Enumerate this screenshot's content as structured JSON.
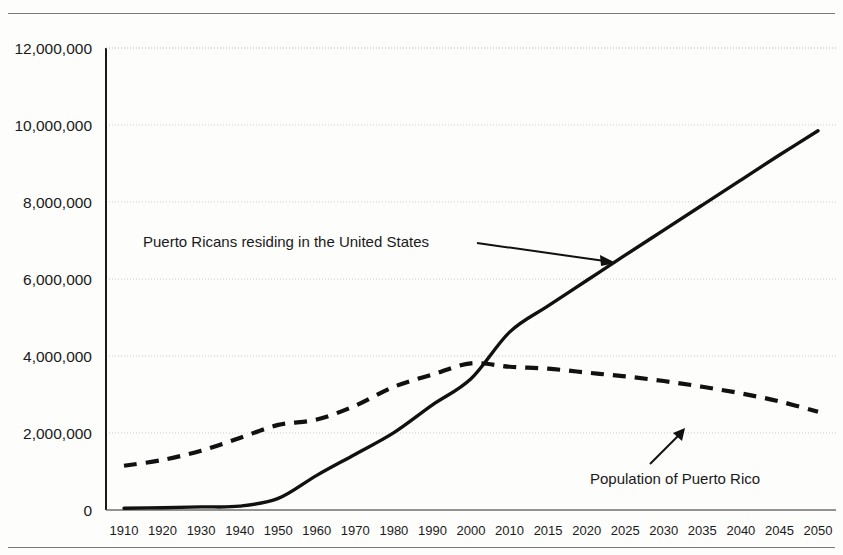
{
  "figure": {
    "top_rule": "horizontal-rule",
    "bottom_rule": "horizontal-rule"
  },
  "chart_data": {
    "type": "line",
    "title": "",
    "xlabel": "",
    "ylabel": "",
    "ylim": [
      0,
      12000000
    ],
    "ytick_labels": [
      "0",
      "2,000,000",
      "4,000,000",
      "6,000,000",
      "8,000,000",
      "10,000,000",
      "12,000,000"
    ],
    "ytick_values": [
      0,
      2000000,
      4000000,
      6000000,
      8000000,
      10000000,
      12000000
    ],
    "grid": "horizontal-dotted",
    "legend_position": "inline-annotations",
    "categories": [
      "1910",
      "1920",
      "1930",
      "1940",
      "1950",
      "1960",
      "1970",
      "1980",
      "1990",
      "2000",
      "2010",
      "2015",
      "2020",
      "2025",
      "2030",
      "2035",
      "2040",
      "2045",
      "2050"
    ],
    "series": [
      {
        "name": "Puerto Ricans residing in the United States",
        "style": "solid",
        "color": "#111111",
        "values": [
          45000,
          60000,
          80000,
          100000,
          300000,
          900000,
          1450000,
          2010000,
          2730000,
          3410000,
          4620000,
          5300000,
          5960000,
          6620000,
          7270000,
          7920000,
          8570000,
          9220000,
          9850000
        ]
      },
      {
        "name": "Population of Puerto Rico",
        "style": "dashed",
        "color": "#111111",
        "values": [
          1150000,
          1300000,
          1540000,
          1870000,
          2210000,
          2350000,
          2710000,
          3200000,
          3520000,
          3810000,
          3720000,
          3670000,
          3570000,
          3470000,
          3350000,
          3200000,
          3030000,
          2820000,
          2550000
        ]
      }
    ],
    "annotations": [
      {
        "text": "Puerto Ricans residing in the United States",
        "target_series": "Puerto Ricans residing in the United States",
        "arrow": "right-down"
      },
      {
        "text": "Population of Puerto Rico",
        "target_series": "Population of Puerto Rico",
        "arrow": "up-right"
      }
    ]
  }
}
